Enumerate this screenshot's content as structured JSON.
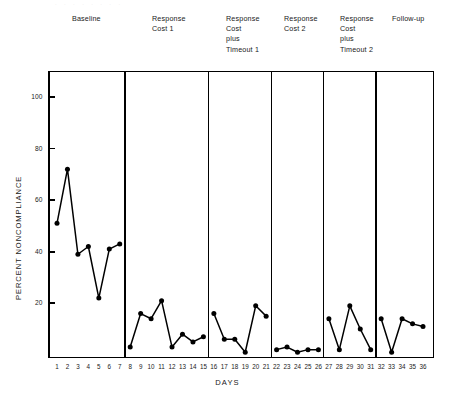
{
  "figure": {
    "y_axis_title": "PERCENT NONCOMPLIANCE",
    "x_axis_title": "DAYS"
  },
  "phases": [
    {
      "label": "Baseline",
      "days": [
        1,
        7
      ]
    },
    {
      "label": "Response\nCost 1",
      "days": [
        8,
        15
      ]
    },
    {
      "label": "Response\nCost\nplus\nTimeout 1",
      "days": [
        16,
        21
      ]
    },
    {
      "label": "Response\nCost 2",
      "days": [
        22,
        26
      ]
    },
    {
      "label": "Response\nCost\nplus\nTimeout 2",
      "days": [
        27,
        31
      ]
    },
    {
      "label": "Follow-up",
      "days": [
        32,
        36
      ]
    }
  ],
  "chart_data": {
    "type": "line",
    "title": "",
    "subtitle": "",
    "xlabel": "DAYS",
    "ylabel": "PERCENT NONCOMPLIANCE",
    "xlim": [
      0.2,
      36.8
    ],
    "ylim": [
      0,
      108
    ],
    "ytick_values": [
      20,
      40,
      60,
      80,
      100
    ],
    "ytick_labels": [
      "20",
      "40",
      "60",
      "80",
      "100"
    ],
    "xtick_values": [
      1,
      2,
      3,
      4,
      5,
      6,
      7,
      8,
      9,
      10,
      11,
      12,
      13,
      14,
      15,
      16,
      17,
      18,
      19,
      20,
      21,
      22,
      23,
      24,
      25,
      26,
      27,
      28,
      29,
      30,
      31,
      32,
      33,
      34,
      35,
      36
    ],
    "xtick_labels": [
      "1",
      "2",
      "3",
      "4",
      "5",
      "6",
      "7",
      "8",
      "9",
      "10",
      "11",
      "12",
      "13",
      "14",
      "15",
      "16",
      "17",
      "18",
      "19",
      "20",
      "21",
      "22",
      "23",
      "24",
      "25",
      "26",
      "27",
      "28",
      "29",
      "30",
      "31",
      "32",
      "33",
      "34",
      "35",
      "36"
    ],
    "grid": false,
    "legend": false,
    "marker": "filled-circle",
    "line_color": "#000000",
    "phase_dividers": [
      7.5,
      15.5,
      21.5,
      26.5,
      31.5
    ],
    "series": [
      {
        "name": "Percent noncompliance",
        "segments": [
          {
            "phase": "Baseline",
            "x": [
              1,
              2,
              3,
              4,
              5,
              6,
              7
            ],
            "values": [
              51,
              72,
              39,
              42,
              22,
              41,
              43
            ]
          },
          {
            "phase": "Response Cost 1",
            "x": [
              8,
              9,
              10,
              11,
              12,
              13,
              14,
              15
            ],
            "values": [
              3,
              16,
              14,
              21,
              3,
              8,
              5,
              7
            ]
          },
          {
            "phase": "Response Cost plus Timeout 1",
            "x": [
              16,
              17,
              18,
              19,
              20,
              21
            ],
            "values": [
              16,
              6,
              6,
              1,
              19,
              15
            ]
          },
          {
            "phase": "Response Cost 2",
            "x": [
              22,
              23,
              24,
              25,
              26
            ],
            "values": [
              2,
              3,
              1,
              2,
              2
            ]
          },
          {
            "phase": "Response Cost plus Timeout 2",
            "x": [
              27,
              28,
              29,
              30,
              31
            ],
            "values": [
              14,
              2,
              19,
              10,
              2
            ]
          },
          {
            "phase": "Follow-up",
            "x": [
              32,
              33,
              34,
              35,
              36
            ],
            "values": [
              14,
              1,
              14,
              12,
              11
            ]
          }
        ]
      }
    ]
  }
}
